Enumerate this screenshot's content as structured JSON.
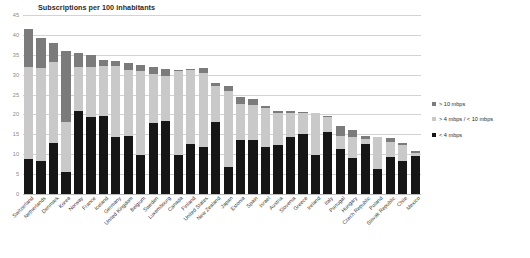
{
  "chart_data": {
    "type": "bar",
    "title": "Subscriptions per 100 inhabitants",
    "xlabel": "",
    "ylabel": "",
    "ylim": [
      0,
      45
    ],
    "yticks": [
      0,
      5,
      10,
      15,
      20,
      25,
      30,
      35,
      40,
      45
    ],
    "grid": true,
    "stacked": true,
    "legend_position": "right",
    "colors": {
      "high": "#7b7b7b",
      "mid": "#c9c9c9",
      "low": "#161616",
      "gridline": "#d3d3d3",
      "text": "#2b2b2b"
    },
    "categories": [
      "Switzerland",
      "Netherlands",
      "Denmark",
      "Korea",
      "Norway",
      "France",
      "Iceland",
      "Germany",
      "United Kingdom",
      "Belgium",
      "Sweden",
      "Luxembourg",
      "Canada",
      "Finland",
      "United States",
      "New Zealand",
      "Japan",
      "Estonia",
      "Spain",
      "Israel",
      "Austria",
      "Slovenia",
      "Greece",
      "Ireland",
      "Italy",
      "Portugal",
      "Hungary",
      "Czech Republic",
      "Poland",
      "Slovak Republic",
      "Chile",
      "Mexico"
    ],
    "series": [
      {
        "name": "< 4 mbps",
        "key": "low",
        "values": [
          8.8,
          8.3,
          12.9,
          5.6,
          20.8,
          19.4,
          19.7,
          14.4,
          14.6,
          9.9,
          17.9,
          18.3,
          9.7,
          12.6,
          11.9,
          18.1,
          6.7,
          13.6,
          13.6,
          11.7,
          12.2,
          14.4,
          15.2,
          9.9,
          15.5,
          11.2,
          9.0,
          12.5,
          6.3,
          9.3,
          8.2,
          9.5
        ]
      },
      {
        "name": "> 4 mbps / < 10 mbps",
        "key": "mid",
        "values": [
          23.2,
          23.4,
          20.3,
          12.6,
          11.2,
          12.6,
          12.4,
          17.8,
          16.6,
          21.0,
          12.4,
          11.4,
          21.2,
          18.6,
          18.5,
          9.1,
          19.1,
          9.0,
          8.7,
          9.9,
          8.1,
          6.0,
          5.2,
          10.5,
          3.8,
          3.5,
          5.3,
          1.4,
          8.1,
          3.9,
          4.0,
          0.9
        ]
      },
      {
        "name": "> 10 mbps",
        "key": "high",
        "values": [
          9.4,
          7.5,
          4.8,
          17.7,
          3.5,
          2.9,
          1.7,
          1.3,
          1.8,
          1.5,
          1.7,
          1.8,
          0.4,
          0.2,
          1.2,
          0.6,
          1.4,
          1.9,
          1.6,
          0.6,
          0.5,
          0.4,
          0.3,
          0.0,
          0.4,
          2.4,
          1.8,
          0.7,
          0.0,
          0.8,
          0.6,
          0.5
        ]
      }
    ],
    "legend": [
      {
        "label": "> 10 mbps",
        "key": "high"
      },
      {
        "label": "> 4 mbps / < 10 mbps",
        "key": "mid"
      },
      {
        "label": "< 4 mbps",
        "key": "low"
      }
    ]
  }
}
